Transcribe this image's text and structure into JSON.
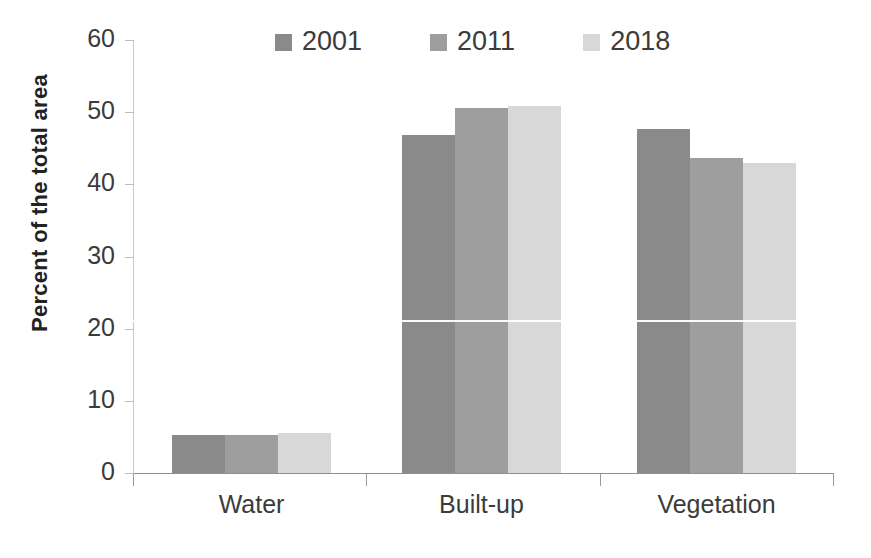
{
  "chart_data": {
    "type": "bar",
    "title": "",
    "xlabel": "",
    "ylabel": "Percent of the total area",
    "ylim": [
      0,
      60
    ],
    "yticks": [
      0,
      10,
      20,
      30,
      40,
      50,
      60
    ],
    "grid": false,
    "legend_position": "top",
    "categories": [
      "Water",
      "Built-up",
      "Vegetation"
    ],
    "series": [
      {
        "name": "2001",
        "color": "#8a8a8a",
        "values": [
          5.2,
          46.8,
          47.7
        ]
      },
      {
        "name": "2011",
        "color": "#9e9e9e",
        "values": [
          5.2,
          50.6,
          43.7
        ]
      },
      {
        "name": "2018",
        "color": "#d8d8d8",
        "values": [
          5.6,
          50.8,
          43.0
        ]
      }
    ]
  },
  "axis": {
    "y_label": "Percent of the total area",
    "y_tick_labels": [
      "0",
      "10",
      "20",
      "30",
      "40",
      "50",
      "60"
    ],
    "x_tick_labels": [
      "Water",
      "Built-up",
      "Vegetation"
    ]
  },
  "legend": {
    "items": [
      {
        "label": "2001",
        "color": "#8a8a8a"
      },
      {
        "label": "2011",
        "color": "#9e9e9e"
      },
      {
        "label": "2018",
        "color": "#d8d8d8"
      }
    ]
  }
}
